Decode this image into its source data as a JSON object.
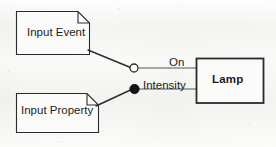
{
  "diagram": {
    "type": "uml-component-diagram",
    "background_color": "#f4f4f2",
    "stroke_color": "#2b2b2b",
    "text_color": "#1b1b1b",
    "shape_fill": "#fbfbfa",
    "notes": [
      {
        "id": "input-event",
        "label": "Input Event",
        "shape": "note-folded-corner",
        "x": 16,
        "y": 11,
        "width": 74,
        "height": 44,
        "fold": 12
      },
      {
        "id": "input-property",
        "label": "Input Property",
        "shape": "note-folded-corner",
        "x": 16,
        "y": 93,
        "width": 83,
        "height": 40,
        "fold": 12
      }
    ],
    "components": [
      {
        "id": "lamp",
        "label": "Lamp",
        "shape": "rectangle",
        "bold": true,
        "x": 196,
        "y": 58,
        "width": 68,
        "height": 45
      }
    ],
    "ports": [
      {
        "id": "on",
        "label": "On",
        "marker": "hollow-circle",
        "cx": 134,
        "cy": 68,
        "r": 4,
        "stem_to_x": 196
      },
      {
        "id": "intensity",
        "label": "Intensity",
        "marker": "filled-circle",
        "cx": 134,
        "cy": 89,
        "r": 4.5,
        "stem_to_x": 196
      }
    ],
    "connectors": [
      {
        "id": "event-to-on",
        "from": "input-event",
        "to": "on",
        "x1": 88,
        "y1": 50,
        "x2": 130,
        "y2": 68
      },
      {
        "id": "property-to-intensity",
        "from": "input-property",
        "to": "intensity",
        "x1": 96,
        "y1": 106,
        "x2": 130,
        "y2": 90
      }
    ]
  }
}
